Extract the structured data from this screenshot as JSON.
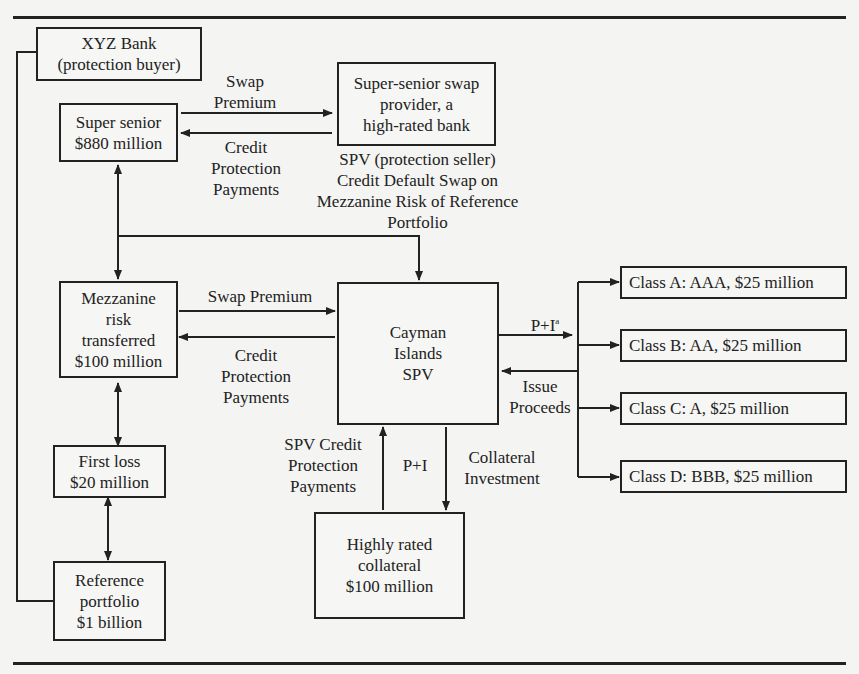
{
  "diagram": {
    "type": "flowchart",
    "nodes": {
      "xyz_bank": "XYZ Bank\n(protection buyer)",
      "super_senior": "Super senior\n$880 million",
      "super_senior_provider": "Super-senior swap\nprovider, a\nhigh-rated bank",
      "mezzanine": "Mezzanine\nrisk\ntransferred\n$100 million",
      "first_loss": "First loss\n$20 million",
      "reference_portfolio": "Reference\nportfolio\n$1 billion",
      "cayman_spv": "Cayman\nIslands\nSPV",
      "collateral": "Highly rated\ncollateral\n$100 million",
      "class_a": "Class A: AAA, $25 million",
      "class_b": "Class B: AA, $25 million",
      "class_c": "Class C: A, $25 million",
      "class_d": "Class D: BBB, $25 million"
    },
    "labels": {
      "swap_premium_top": "Swap\nPremium",
      "credit_protection_top": "Credit\nProtection\nPayments",
      "spv_cds_note": "SPV (protection seller)\nCredit Default Swap on\nMezzanine Risk of Reference\nPortfolio",
      "swap_premium_mid": "Swap Premium",
      "credit_protection_mid": "Credit\nProtection\nPayments",
      "p_plus_i_a": "P+I",
      "p_plus_i_a_footnote": "a",
      "issue_proceeds": "Issue\nProceeds",
      "spv_credit_protection": "SPV Credit\nProtection\nPayments",
      "p_plus_i": "P+I",
      "collateral_investment": "Collateral\nInvestment"
    },
    "colors": {
      "line": "#222222",
      "background": "#f4f4f2"
    }
  }
}
